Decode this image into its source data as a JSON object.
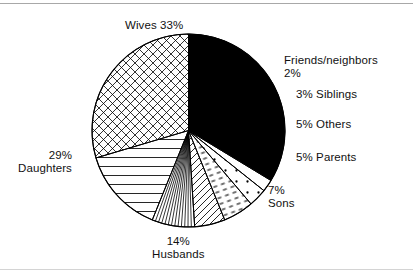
{
  "chart_data": {
    "type": "pie",
    "title": "",
    "subtitle": "",
    "xlabel": "",
    "ylabel": "",
    "legend_position": "callout-labels",
    "grid": false,
    "total_percent": 98,
    "units": "%",
    "start_angle_deg": -90,
    "direction": "clockwise",
    "categories": [
      "Wives",
      "Friends/neighbors",
      "Siblings",
      "Others",
      "Parents",
      "Sons",
      "Husbands",
      "Daughters"
    ],
    "values": [
      33,
      2,
      3,
      5,
      5,
      7,
      14,
      29
    ],
    "slices": [
      {
        "label": "Wives",
        "percent": 33,
        "value_text": "33%",
        "fill": "solid-black",
        "label_text": "Wives  33%"
      },
      {
        "label": "Friends/neighbors",
        "percent": 2,
        "value_text": "2%",
        "fill": "white",
        "label_text": "Friends/neighbors"
      },
      {
        "label": "Siblings",
        "percent": 3,
        "value_text": "3%",
        "fill": "dots",
        "label_text": "3%   Siblings"
      },
      {
        "label": "Others",
        "percent": 5,
        "value_text": "5%",
        "fill": "dashes",
        "label_text": "5%   Others"
      },
      {
        "label": "Parents",
        "percent": 5,
        "value_text": "5%",
        "fill": "diagonal-up",
        "label_text": "5%   Parents"
      },
      {
        "label": "Sons",
        "percent": 7,
        "value_text": "7%",
        "fill": "radial-fan",
        "label_text": "7%  Sons"
      },
      {
        "label": "Husbands",
        "percent": 14,
        "value_text": "14%",
        "fill": "horizontal",
        "label_text": "14%  Husbands"
      },
      {
        "label": "Daughters",
        "percent": 29,
        "value_text": "29%",
        "fill": "cross-hatch",
        "label_text": "29%  Daughters"
      }
    ],
    "colors": {
      "stroke": "#000000",
      "background": "#ffffff",
      "solid_slice": "#000000",
      "rule": "#a8a8a8"
    }
  },
  "labels": {
    "wives": "Wives  33%",
    "friends_neighbors": "Friends/neighbors",
    "friends_pct": "2%",
    "siblings": "3%   Siblings",
    "others": "5%   Others",
    "parents": "5%   Parents",
    "sons_pct": "7%",
    "sons_name": "Sons",
    "husbands_pct": "14%",
    "husbands_name": "Husbands",
    "daughters_pct": "29%",
    "daughters_name": "Daughters"
  }
}
